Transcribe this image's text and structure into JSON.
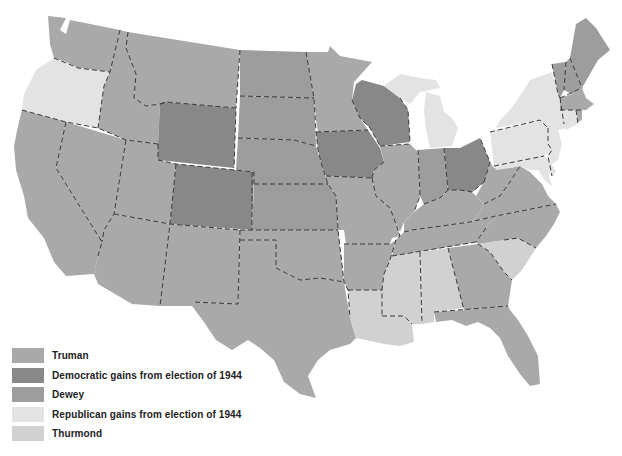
{
  "legend": {
    "items": [
      {
        "key": "truman",
        "label": "Truman",
        "color": "#a9a9a9"
      },
      {
        "key": "dem_gain",
        "label": "Democratic gains from election of 1944",
        "color": "#888888"
      },
      {
        "key": "dewey",
        "label": "Dewey",
        "color": "#9d9d9d"
      },
      {
        "key": "rep_gain",
        "label": "Republican gains from election of 1944",
        "color": "#e3e3e3"
      },
      {
        "key": "thurmond",
        "label": "Thurmond",
        "color": "#d1d1d1"
      }
    ]
  },
  "map": {
    "subject": "United States presidential election results by state",
    "states": {
      "washington": "truman",
      "oregon": "rep_gain",
      "california": "truman",
      "idaho": "truman",
      "nevada": "truman",
      "montana": "truman",
      "wyoming": "dem_gain",
      "utah": "truman",
      "colorado": "dem_gain",
      "arizona": "truman",
      "new_mexico": "truman",
      "north_dakota": "dewey",
      "south_dakota": "dewey",
      "nebraska": "dewey",
      "kansas": "dewey",
      "oklahoma": "truman",
      "texas": "truman",
      "minnesota": "truman",
      "iowa": "dem_gain",
      "missouri": "truman",
      "arkansas": "truman",
      "louisiana": "thurmond",
      "wisconsin": "dem_gain",
      "illinois": "truman",
      "michigan": "rep_gain",
      "indiana": "dewey",
      "ohio": "dem_gain",
      "kentucky": "truman",
      "tennessee": "truman",
      "mississippi": "thurmond",
      "alabama": "thurmond",
      "georgia": "truman",
      "florida": "truman",
      "south_carolina": "thurmond",
      "north_carolina": "truman",
      "virginia": "truman",
      "west_virginia": "truman",
      "maryland": "rep_gain",
      "delaware": "rep_gain",
      "new_jersey": "rep_gain",
      "pennsylvania": "rep_gain",
      "new_york": "rep_gain",
      "connecticut": "rep_gain",
      "rhode_island": "truman",
      "massachusetts": "truman",
      "vermont": "dewey",
      "new_hampshire": "dewey",
      "maine": "dewey"
    }
  }
}
